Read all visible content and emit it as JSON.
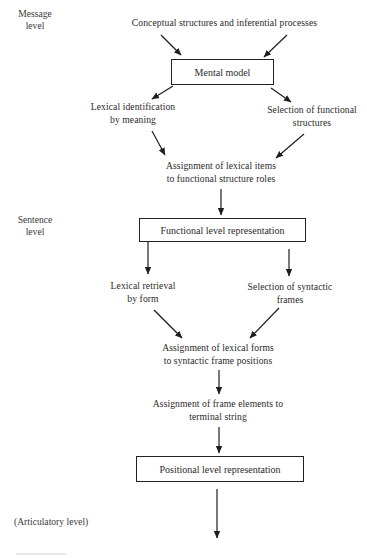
{
  "diagram": {
    "type": "flowchart",
    "levels": {
      "message": {
        "line1": "Message",
        "line2": "level"
      },
      "sentence": {
        "line1": "Sentence",
        "line2": "level"
      },
      "articulatory": "(Articulatory level)"
    },
    "nodes": {
      "conceptual": "Conceptual structures and inferential processes",
      "mental_model": "Mental model",
      "lexical_identification": {
        "line1": "Lexical identification",
        "line2": "by meaning"
      },
      "selection_functional": {
        "line1": "Selection of functional",
        "line2": "structures"
      },
      "assignment_lexical_items": {
        "line1": "Assignment of lexical items",
        "line2": "to functional structure roles"
      },
      "functional_level": "Functional level representation",
      "lexical_retrieval": {
        "line1": "Lexical retrieval",
        "line2": "by form"
      },
      "selection_syntactic": {
        "line1": "Selection of syntactic",
        "line2": "frames"
      },
      "assignment_lexical_forms": {
        "line1": "Assignment of lexical forms",
        "line2": "to syntactic frame positions"
      },
      "assignment_frame_elements": {
        "line1": "Assignment of frame elements to",
        "line2": "terminal string"
      },
      "positional_level": "Positional level representation"
    },
    "edges": [
      {
        "from": "conceptual",
        "to": "mental_model"
      },
      {
        "from": "conceptual",
        "to": "mental_model"
      },
      {
        "from": "mental_model",
        "to": "lexical_identification"
      },
      {
        "from": "mental_model",
        "to": "selection_functional"
      },
      {
        "from": "lexical_identification",
        "to": "assignment_lexical_items"
      },
      {
        "from": "selection_functional",
        "to": "assignment_lexical_items"
      },
      {
        "from": "assignment_lexical_items",
        "to": "functional_level"
      },
      {
        "from": "functional_level",
        "to": "lexical_retrieval"
      },
      {
        "from": "functional_level",
        "to": "selection_syntactic"
      },
      {
        "from": "lexical_retrieval",
        "to": "assignment_lexical_forms"
      },
      {
        "from": "selection_syntactic",
        "to": "assignment_lexical_forms"
      },
      {
        "from": "assignment_lexical_forms",
        "to": "assignment_frame_elements"
      },
      {
        "from": "assignment_frame_elements",
        "to": "positional_level"
      },
      {
        "from": "positional_level",
        "to": "articulatory"
      }
    ]
  }
}
